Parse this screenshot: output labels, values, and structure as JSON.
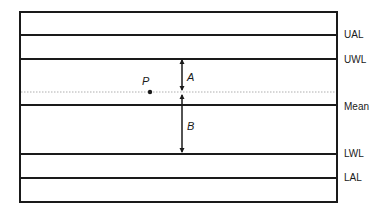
{
  "diagram": {
    "type": "control-chart",
    "colors": {
      "line": "#1a1a1a",
      "dotted": "#9a9a9a",
      "background": "#ffffff"
    },
    "lines": [
      {
        "id": "ual",
        "label": "UAL",
        "y": 35
      },
      {
        "id": "uwl",
        "label": "UWL",
        "y": 59
      },
      {
        "id": "mean",
        "label": "Mean",
        "y": 105
      },
      {
        "id": "lwl",
        "label": "LWL",
        "y": 154
      },
      {
        "id": "lal",
        "label": "LAL",
        "y": 178
      }
    ],
    "point": {
      "label": "P"
    },
    "distances": {
      "a": {
        "label": "A"
      },
      "b": {
        "label": "B"
      }
    }
  }
}
